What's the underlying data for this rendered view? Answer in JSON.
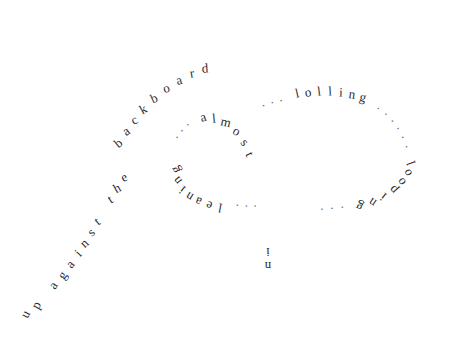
{
  "canvas": {
    "width": 454,
    "height": 344,
    "background_color": "#ffffff",
    "text_color": "#2b2b30",
    "dot_color": "#6f6f78"
  },
  "poem": {
    "title_text": "up against the backboard ... lolling ... almost leaning ... looping ... in",
    "lines": [
      {
        "id": "arc-backboard",
        "text": "up against the backboard",
        "path": "open-arc",
        "orientation": "upright"
      },
      {
        "id": "outer-lolling",
        "text": "... lolling ...",
        "path": "outer-ellipse-top",
        "orientation": "upright"
      },
      {
        "id": "outer-looping",
        "text": "... looping ...",
        "path": "outer-ellipse-bottom",
        "orientation": "inverted"
      },
      {
        "id": "inner-almost",
        "text": "... almost",
        "path": "inner-ellipse-top",
        "orientation": "upright"
      },
      {
        "id": "inner-leaning",
        "text": "leaning ...",
        "path": "inner-ellipse-bottom",
        "orientation": "inverted"
      },
      {
        "id": "word-in",
        "text": "in",
        "path": "below-inner-ellipse",
        "orientation": "inverted"
      }
    ]
  },
  "glyphs": {
    "arc": [
      {
        "ch": "u",
        "x": 25,
        "y": 314,
        "rot": -62
      },
      {
        "ch": "p",
        "x": 36,
        "y": 305,
        "rot": -60
      },
      {
        "ch": " ",
        "x": 45,
        "y": 296,
        "rot": -58
      },
      {
        "ch": "a",
        "x": 53,
        "y": 285,
        "rot": -56
      },
      {
        "ch": "g",
        "x": 62,
        "y": 275,
        "rot": -53
      },
      {
        "ch": "a",
        "x": 70,
        "y": 264,
        "rot": -50
      },
      {
        "ch": "i",
        "x": 78,
        "y": 253,
        "rot": -47
      },
      {
        "ch": "n",
        "x": 84,
        "y": 243,
        "rot": -44
      },
      {
        "ch": "s",
        "x": 91,
        "y": 232,
        "rot": -41
      },
      {
        "ch": "t",
        "x": 97,
        "y": 221,
        "rot": -38
      },
      {
        "ch": " ",
        "x": 103,
        "y": 211,
        "rot": -35
      },
      {
        "ch": "t",
        "x": 110,
        "y": 199,
        "rot": -32
      },
      {
        "ch": "h",
        "x": 117,
        "y": 188,
        "rot": -29
      },
      {
        "ch": "e",
        "x": 124,
        "y": 177,
        "rot": -26
      },
      {
        "ch": " ",
        "x": 130,
        "y": 167,
        "rot": -22
      },
      {
        "ch": "b",
        "x": 118,
        "y": 143,
        "rot": -40
      },
      {
        "ch": "a",
        "x": 126,
        "y": 131,
        "rot": -36
      },
      {
        "ch": "c",
        "x": 134,
        "y": 120,
        "rot": -32
      },
      {
        "ch": "k",
        "x": 143,
        "y": 109,
        "rot": -28
      },
      {
        "ch": "b",
        "x": 154,
        "y": 98,
        "rot": -24
      },
      {
        "ch": "o",
        "x": 166,
        "y": 88,
        "rot": -19
      },
      {
        "ch": "a",
        "x": 179,
        "y": 80,
        "rot": -14
      },
      {
        "ch": "r",
        "x": 192,
        "y": 73,
        "rot": -9
      },
      {
        "ch": "d",
        "x": 205,
        "y": 68,
        "rot": -4
      }
    ],
    "outer_top": [
      {
        "ch": ".",
        "x": 262,
        "y": 102,
        "rot": -22,
        "dot": true
      },
      {
        "ch": ".",
        "x": 271,
        "y": 99,
        "rot": -20,
        "dot": true
      },
      {
        "ch": ".",
        "x": 280,
        "y": 97,
        "rot": -18,
        "dot": true
      },
      {
        "ch": "l",
        "x": 297,
        "y": 93,
        "rot": -13
      },
      {
        "ch": "o",
        "x": 308,
        "y": 92,
        "rot": -10
      },
      {
        "ch": "l",
        "x": 319,
        "y": 91,
        "rot": -7
      },
      {
        "ch": "l",
        "x": 330,
        "y": 91,
        "rot": -3
      },
      {
        "ch": "i",
        "x": 341,
        "y": 92,
        "rot": 2
      },
      {
        "ch": "n",
        "x": 352,
        "y": 94,
        "rot": 8
      },
      {
        "ch": "g",
        "x": 363,
        "y": 97,
        "rot": 15
      },
      {
        "ch": ".",
        "x": 380,
        "y": 105,
        "rot": 28,
        "dot": true
      },
      {
        "ch": ".",
        "x": 388,
        "y": 111,
        "rot": 34,
        "dot": true
      },
      {
        "ch": ".",
        "x": 395,
        "y": 118,
        "rot": 40,
        "dot": true
      },
      {
        "ch": ".",
        "x": 401,
        "y": 126,
        "rot": 48,
        "dot": true
      },
      {
        "ch": ".",
        "x": 406,
        "y": 135,
        "rot": 56,
        "dot": true
      },
      {
        "ch": ".",
        "x": 410,
        "y": 145,
        "rot": 64,
        "dot": true
      }
    ],
    "outer_bottom": [
      {
        "ch": "l",
        "x": 411,
        "y": 163,
        "rot": 250
      },
      {
        "ch": "o",
        "x": 407,
        "y": 173,
        "rot": 244
      },
      {
        "ch": "o",
        "x": 401,
        "y": 182,
        "rot": 236
      },
      {
        "ch": "p",
        "x": 393,
        "y": 190,
        "rot": 228
      },
      {
        "ch": "i",
        "x": 383,
        "y": 197,
        "rot": 220
      },
      {
        "ch": "n",
        "x": 372,
        "y": 203,
        "rot": 213
      },
      {
        "ch": "g",
        "x": 359,
        "y": 207,
        "rot": 207
      },
      {
        "ch": ".",
        "x": 341,
        "y": 211,
        "rot": 200,
        "dot": true
      },
      {
        "ch": ".",
        "x": 331,
        "y": 212,
        "rot": 197,
        "dot": true
      },
      {
        "ch": ".",
        "x": 321,
        "y": 213,
        "rot": 195,
        "dot": true
      }
    ],
    "inner_top": [
      {
        "ch": ".",
        "x": 174,
        "y": 135,
        "rot": -52,
        "dot": true
      },
      {
        "ch": ".",
        "x": 179,
        "y": 128,
        "rot": -48,
        "dot": true
      },
      {
        "ch": ".",
        "x": 185,
        "y": 122,
        "rot": -44,
        "dot": true
      },
      {
        "ch": "a",
        "x": 203,
        "y": 117,
        "rot": -16
      },
      {
        "ch": "l",
        "x": 214,
        "y": 118,
        "rot": -5
      },
      {
        "ch": "m",
        "x": 226,
        "y": 122,
        "rot": 12
      },
      {
        "ch": "o",
        "x": 237,
        "y": 131,
        "rot": 32
      },
      {
        "ch": "s",
        "x": 245,
        "y": 142,
        "rot": 50
      },
      {
        "ch": "t",
        "x": 250,
        "y": 154,
        "rot": 66
      }
    ],
    "inner_bottom": [
      {
        "ch": "g",
        "x": 175,
        "y": 170,
        "rot": 248
      },
      {
        "ch": "n",
        "x": 177,
        "y": 181,
        "rot": 232
      },
      {
        "ch": "i",
        "x": 182,
        "y": 190,
        "rot": 220
      },
      {
        "ch": "n",
        "x": 189,
        "y": 197,
        "rot": 212
      },
      {
        "ch": "a",
        "x": 198,
        "y": 202,
        "rot": 203
      },
      {
        "ch": "e",
        "x": 209,
        "y": 206,
        "rot": 196
      },
      {
        "ch": "l",
        "x": 220,
        "y": 208,
        "rot": 191
      },
      {
        "ch": ".",
        "x": 237,
        "y": 209,
        "rot": 186,
        "dot": true
      },
      {
        "ch": ".",
        "x": 246,
        "y": 210,
        "rot": 184,
        "dot": true
      },
      {
        "ch": ".",
        "x": 255,
        "y": 210,
        "rot": 182,
        "dot": true
      }
    ],
    "word_in": [
      {
        "ch": "i",
        "x": 268,
        "y": 252,
        "rot": 180
      },
      {
        "ch": "n",
        "x": 268,
        "y": 266,
        "rot": 180
      }
    ]
  }
}
